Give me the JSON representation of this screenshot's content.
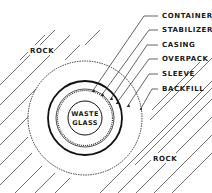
{
  "diagram": {
    "type": "cross-section",
    "center_label": [
      "WASTE",
      "GLASS"
    ],
    "layers": [
      {
        "label": "CONTAINER",
        "y": 16
      },
      {
        "label": "STABILIZER",
        "y": 30
      },
      {
        "label": "CASING",
        "y": 45
      },
      {
        "label": "OVERPACK",
        "y": 59
      },
      {
        "label": "SLEEVE",
        "y": 74
      },
      {
        "label": "BACKFILL",
        "y": 89
      }
    ],
    "rock_labels": [
      {
        "label": "ROCK",
        "x": 30,
        "y": 52
      },
      {
        "label": "ROCK",
        "x": 153,
        "y": 160
      }
    ],
    "colors": {
      "ink": "#1a1a1a",
      "background": "#ffffff"
    }
  }
}
